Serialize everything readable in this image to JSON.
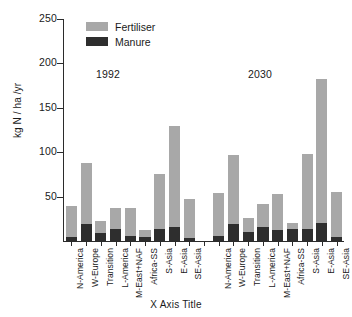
{
  "chart_data": {
    "type": "bar",
    "title": "",
    "subtitle": "",
    "xlabel": "X Axis Title",
    "ylabel": "kg N / ha /yr",
    "ylim": [
      0,
      250
    ],
    "yticks": [
      0,
      50,
      100,
      150,
      200,
      250
    ],
    "ytick_labels": [
      "",
      "50",
      "100",
      "150",
      "200",
      "250"
    ],
    "grid": false,
    "stacked": true,
    "legend_position": "top-left-inside",
    "legend": [
      "Fertiliser",
      "Manure"
    ],
    "colors": {
      "fertiliser": "#a8a8a8",
      "manure": "#2e2e2e",
      "axis": "#2b2b2b",
      "text": "#1a1a1a",
      "background": "#ffffff"
    },
    "annotations": [
      {
        "text": "1992",
        "x_category": "L-America",
        "y_value": 195
      },
      {
        "text": "2030",
        "x_category": "Transition (2030)",
        "y_value": 195
      }
    ],
    "categories": [
      "N-America",
      "W-Europe",
      "Transition",
      "L-America",
      "M-East+NAF",
      "Africa-SS",
      "S-Asia",
      "E-Asia",
      "SE-Asia",
      "",
      "N-America",
      "W-Europe",
      "Transition",
      "L-America",
      "M-East+NAF",
      "Africa-SS",
      "S-Asia",
      "E-Asia",
      "SE-Asia"
    ],
    "series": [
      {
        "name": "Manure",
        "values": [
          4,
          19,
          9,
          14,
          6,
          5,
          13,
          16,
          3,
          null,
          6,
          19,
          10,
          16,
          12,
          13,
          14,
          20,
          4
        ]
      },
      {
        "name": "Fertiliser",
        "values": [
          35,
          69,
          14,
          23,
          31,
          7,
          63,
          113,
          44,
          null,
          48,
          78,
          16,
          26,
          41,
          7,
          84,
          162,
          51
        ]
      }
    ],
    "totals": [
      39,
      88,
      23,
      37,
      37,
      12,
      76,
      129,
      47,
      null,
      54,
      97,
      26,
      42,
      53,
      20,
      98,
      182,
      55
    ],
    "group_labels": [
      "1992",
      "2030"
    ]
  },
  "legend": {
    "items": [
      {
        "label": "Fertiliser",
        "color": "#a8a8a8"
      },
      {
        "label": "Manure",
        "color": "#2e2e2e"
      }
    ]
  },
  "axes": {
    "y_title": "kg N / ha /yr",
    "x_title": "X Axis Title",
    "y_labels": [
      "250",
      "200",
      "150",
      "100",
      "50"
    ]
  },
  "annotations": {
    "left_year": "1992",
    "right_year": "2030"
  }
}
